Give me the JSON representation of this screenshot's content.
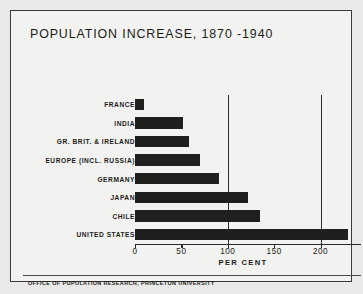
{
  "chart_data": {
    "type": "bar",
    "orientation": "horizontal",
    "title": "POPULATION INCREASE, 1870 -1940",
    "xlabel": "PER CENT",
    "ylabel": "",
    "categories": [
      "FRANCE",
      "INDIA",
      "GR. BRIT. & IRELAND",
      "EUROPE (INCL. RUSSIA)",
      "GERMANY",
      "JAPAN",
      "CHILE",
      "UNITED STATES"
    ],
    "values": [
      10,
      52,
      58,
      70,
      90,
      122,
      135,
      229
    ],
    "xlim": [
      0,
      247
    ],
    "xticks": [
      0,
      50,
      100,
      150,
      200
    ],
    "xtick_labels": [
      "0",
      "50",
      "100",
      "150",
      "200"
    ],
    "gridlines_at": [
      100,
      200
    ],
    "grid": true,
    "legend": null,
    "bar_color": "#1f1f1e",
    "background_color": "#f2f2f0",
    "axis_color": "#2a2a28"
  },
  "footer": {
    "credit": "OFFICE OF POPULATION RESEARCH, PRINCETON UNIVERSITY"
  }
}
